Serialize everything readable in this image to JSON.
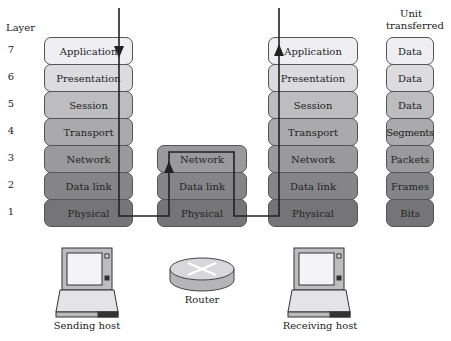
{
  "header": {
    "layer_label": "Layer",
    "unit_label_1": "Unit",
    "unit_label_2": "transferred"
  },
  "layers": [
    {
      "num": "7",
      "name": "Application",
      "unit": "Data"
    },
    {
      "num": "6",
      "name": "Presentation",
      "unit": "Data"
    },
    {
      "num": "5",
      "name": "Session",
      "unit": "Data"
    },
    {
      "num": "4",
      "name": "Transport",
      "unit": "Segments"
    },
    {
      "num": "3",
      "name": "Network",
      "unit": "Packets"
    },
    {
      "num": "2",
      "name": "Data link",
      "unit": "Frames"
    },
    {
      "num": "1",
      "name": "Physical",
      "unit": "Bits"
    }
  ],
  "router_stack": [
    "Network",
    "Data link",
    "Physical"
  ],
  "devices": {
    "sender": "Sending host",
    "router": "Router",
    "receiver": "Receiving host"
  }
}
